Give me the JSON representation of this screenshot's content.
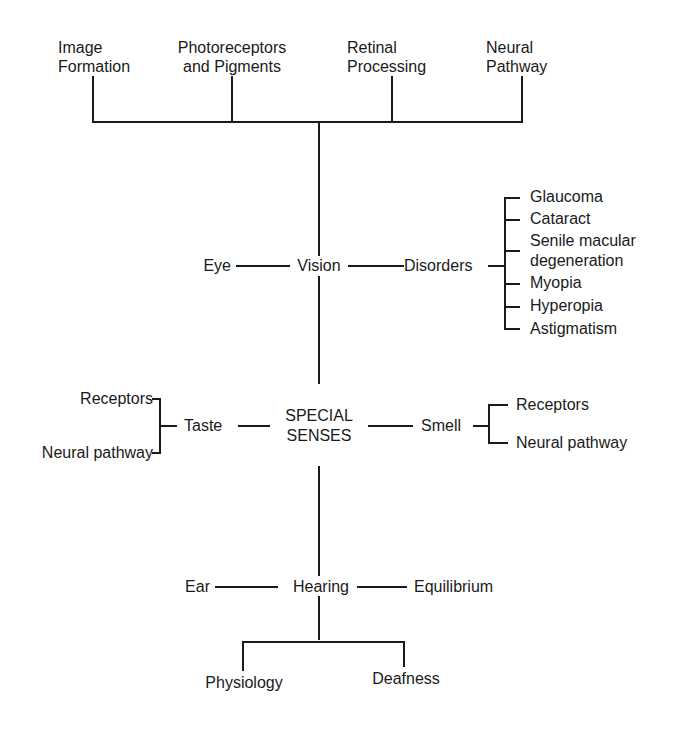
{
  "diagram": {
    "root": {
      "line1": "SPECIAL",
      "line2": "SENSES"
    },
    "vision": {
      "label": "Vision",
      "left": "Eye",
      "right": "Disorders",
      "top_topics": [
        {
          "line1": "Image",
          "line2": "Formation"
        },
        {
          "line1": "Photoreceptors",
          "line2": "and Pigments"
        },
        {
          "line1": "Retinal",
          "line2": "Processing"
        },
        {
          "line1": "Neural",
          "line2": "Pathway"
        }
      ],
      "disorders": [
        "Glaucoma",
        "Cataract",
        "Senile macular",
        "degeneration",
        "Myopia",
        "Hyperopia",
        "Astigmatism"
      ]
    },
    "taste": {
      "label": "Taste",
      "items": [
        "Receptors",
        "Neural pathway"
      ]
    },
    "smell": {
      "label": "Smell",
      "items": [
        "Receptors",
        "Neural pathway"
      ]
    },
    "hearing": {
      "label": "Hearing",
      "left": "Ear",
      "right": "Equilibrium",
      "children": [
        "Physiology",
        "Deafness"
      ]
    }
  }
}
